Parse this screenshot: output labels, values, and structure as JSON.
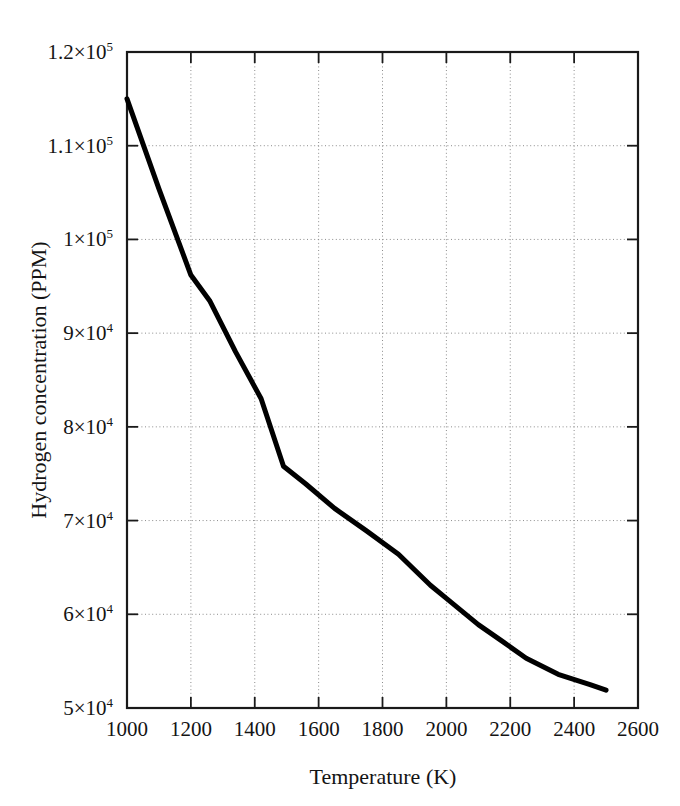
{
  "figure": {
    "background_color": "#ffffff",
    "frame_color": "#1a1a1a",
    "grid_color": "#8c8c8c",
    "curve_color": "#000000"
  },
  "chart_data": {
    "type": "line",
    "title": "",
    "xlabel": "Temperature (K)",
    "ylabel": "Hydrogen concentration (PPM)",
    "xlim": [
      1000,
      2600
    ],
    "ylim": [
      50000,
      120000
    ],
    "grid": true,
    "legend": "none",
    "xticks": [
      1000,
      1200,
      1400,
      1600,
      1800,
      2000,
      2200,
      2400,
      2600
    ],
    "xtick_labels": [
      "1000",
      "1200",
      "1400",
      "1600",
      "1800",
      "2000",
      "2200",
      "2400",
      "2600"
    ],
    "yticks": [
      50000,
      60000,
      70000,
      80000,
      90000,
      100000,
      110000,
      120000
    ],
    "ytick_labels": [
      {
        "mantissa": "5×10",
        "exponent": "4"
      },
      {
        "mantissa": "6×10",
        "exponent": "4"
      },
      {
        "mantissa": "7×10",
        "exponent": "4"
      },
      {
        "mantissa": "8×10",
        "exponent": "4"
      },
      {
        "mantissa": "9×10",
        "exponent": "4"
      },
      {
        "mantissa": "1×10",
        "exponent": "5"
      },
      {
        "mantissa": "1.1×10",
        "exponent": "5"
      },
      {
        "mantissa": "1.2×10",
        "exponent": "5"
      }
    ],
    "series": [
      {
        "name": "Hydrogen concentration",
        "line_width": 5,
        "color": "#000000",
        "x": [
          1000,
          1100,
          1200,
          1260,
          1340,
          1420,
          1490,
          1560,
          1650,
          1750,
          1850,
          1950,
          2000,
          2100,
          2180,
          2250,
          2350,
          2450,
          2500
        ],
        "y": [
          115000,
          105400,
          96200,
          93400,
          88000,
          83000,
          75800,
          73900,
          71300,
          68900,
          66400,
          63100,
          61700,
          58900,
          57000,
          55300,
          53600,
          52500,
          51900
        ]
      }
    ]
  }
}
